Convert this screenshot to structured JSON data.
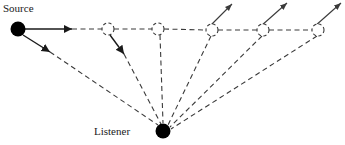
{
  "figure": {
    "width": 345,
    "height": 145,
    "background": "#ffffff",
    "stroke_color": "#3a3a3a",
    "solid_stroke_color": "#1a1a1a",
    "marker_fill": "#000000"
  },
  "labels": {
    "source": "Source",
    "listener": "Listener"
  },
  "nodes": {
    "source": {
      "label": "Source",
      "cx": 18,
      "cy": 29,
      "r": 7.5,
      "fill": "#000000"
    },
    "listener": {
      "label": "Listener",
      "cx": 163,
      "cy": 131,
      "r": 7.5,
      "fill": "#000000"
    },
    "image_sources": [
      {
        "id": "image-source-1",
        "cx": 108,
        "cy": 29,
        "r": 6
      },
      {
        "id": "image-source-2",
        "cx": 158,
        "cy": 29,
        "r": 6
      },
      {
        "id": "image-source-3",
        "cx": 212,
        "cy": 30,
        "r": 6
      },
      {
        "id": "image-source-4",
        "cx": 263,
        "cy": 30,
        "r": 6
      },
      {
        "id": "image-source-5",
        "cx": 318,
        "cy": 30,
        "r": 6
      }
    ]
  },
  "label_positions": {
    "source": {
      "x": 3,
      "y": 12
    },
    "listener": {
      "x": 94,
      "y": 135
    }
  },
  "solid_rays": [
    {
      "id": "source-ray-horizontal",
      "x1": 25,
      "y1": 29,
      "x2": 72,
      "y2": 29,
      "arrow": true
    },
    {
      "id": "source-ray-diagonal",
      "x1": 23,
      "y1": 35,
      "x2": 50,
      "y2": 52,
      "arrow": true
    },
    {
      "id": "reflection-ray-down",
      "x1": 110,
      "y1": 35,
      "x2": 124,
      "y2": 54,
      "arrow": true
    }
  ],
  "dashed_horizontal": [
    {
      "id": "axis-seg-1",
      "x1": 72,
      "y1": 29,
      "x2": 102,
      "y2": 29
    },
    {
      "id": "axis-seg-2",
      "x1": 114,
      "y1": 29,
      "x2": 152,
      "y2": 29
    },
    {
      "id": "axis-seg-3",
      "x1": 164,
      "y1": 29,
      "x2": 206,
      "y2": 30
    },
    {
      "id": "axis-seg-4",
      "x1": 218,
      "y1": 30,
      "x2": 257,
      "y2": 30
    },
    {
      "id": "axis-seg-5",
      "x1": 269,
      "y1": 30,
      "x2": 312,
      "y2": 30
    }
  ],
  "dashed_to_listener": [
    {
      "id": "listener-ray-0",
      "x1": 50,
      "y1": 52,
      "x2": 158,
      "y2": 125
    },
    {
      "id": "listener-ray-1",
      "x1": 124,
      "y1": 54,
      "x2": 161,
      "y2": 124
    },
    {
      "id": "listener-ray-2",
      "x1": 160,
      "y1": 35,
      "x2": 163,
      "y2": 123
    },
    {
      "id": "listener-ray-3",
      "x1": 211,
      "y1": 36,
      "x2": 168,
      "y2": 125
    },
    {
      "id": "listener-ray-4",
      "x1": 262,
      "y1": 36,
      "x2": 170,
      "y2": 127
    },
    {
      "id": "listener-ray-5",
      "x1": 317,
      "y1": 36,
      "x2": 171,
      "y2": 129
    }
  ],
  "dashed_outgoing_arrows": [
    {
      "id": "outgoing-arrow-3",
      "x1": 210,
      "y1": 26,
      "x2": 232,
      "y2": 4
    },
    {
      "id": "outgoing-arrow-4",
      "x1": 261,
      "y1": 26,
      "x2": 287,
      "y2": 3
    },
    {
      "id": "outgoing-arrow-5",
      "x1": 315,
      "y1": 26,
      "x2": 341,
      "y2": 3
    }
  ]
}
